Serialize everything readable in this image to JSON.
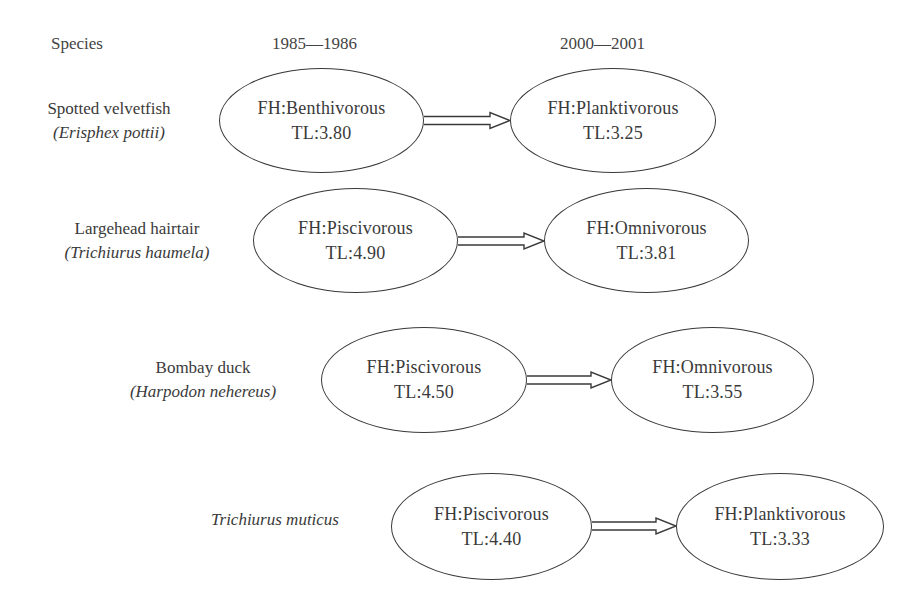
{
  "headers": {
    "species": "Species",
    "period_1": "1985—1986",
    "period_2": "2000—2001"
  },
  "rows": [
    {
      "common_name": "Spotted velvetfish",
      "scientific_name": "(Erisphex pottii)",
      "before": {
        "fh": "FH:Benthivorous",
        "tl": "TL:3.80"
      },
      "after": {
        "fh": "FH:Planktivorous",
        "tl": "TL:3.25"
      }
    },
    {
      "common_name": "Largehead hairtair",
      "scientific_name": "(Trichiurus haumela)",
      "before": {
        "fh": "FH:Piscivorous",
        "tl": "TL:4.90"
      },
      "after": {
        "fh": "FH:Omnivorous",
        "tl": "TL:3.81"
      }
    },
    {
      "common_name": "Bombay duck",
      "scientific_name": "(Harpodon nehereus)",
      "before": {
        "fh": "FH:Piscivorous",
        "tl": "TL:4.50"
      },
      "after": {
        "fh": "FH:Omnivorous",
        "tl": "TL:3.55"
      }
    },
    {
      "common_name": "",
      "scientific_name": "Trichiurus muticus",
      "before": {
        "fh": "FH:Piscivorous",
        "tl": "TL:4.40"
      },
      "after": {
        "fh": "FH:Planktivorous",
        "tl": "TL:3.33"
      }
    }
  ],
  "colors": {
    "stroke": "#3a3a3a",
    "text": "#3a3a3a",
    "background": "#ffffff"
  }
}
